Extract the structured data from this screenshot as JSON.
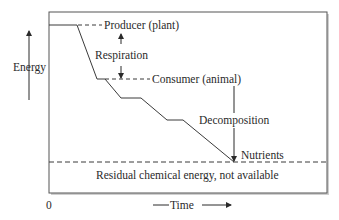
{
  "diagram": {
    "y_axis_label": "Energy",
    "x_axis_label": "Time",
    "origin_label": "0",
    "labels": {
      "producer": "Producer (plant)",
      "respiration": "Respiration",
      "consumer": "Consumer (animal)",
      "decomposition": "Decomposition",
      "nutrients": "Nutrients",
      "residual": "Residual chemical energy, not available"
    },
    "colors": {
      "line": "#3a3a3a",
      "frame": "#555555",
      "text": "#2a2a2a",
      "background": "#ffffff"
    }
  }
}
